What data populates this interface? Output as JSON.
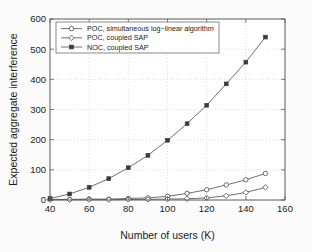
{
  "chart_data": {
    "type": "line",
    "title": "",
    "xlabel": "Number of users (K)",
    "ylabel": "Expected aggregate interference",
    "xlim": [
      40,
      160
    ],
    "ylim": [
      0,
      600
    ],
    "xticks": [
      40,
      60,
      80,
      100,
      120,
      140,
      160
    ],
    "yticks": [
      0,
      100,
      200,
      300,
      400,
      500,
      600
    ],
    "grid": true,
    "legend_position": "top-left",
    "x": [
      40,
      50,
      60,
      70,
      80,
      90,
      100,
      110,
      120,
      130,
      140,
      150
    ],
    "series": [
      {
        "name": "POC, simultaneous log−linear  algorithm",
        "marker": "circle-open",
        "values": [
          2,
          2,
          3,
          3,
          5,
          7,
          12,
          22,
          34,
          50,
          67,
          88
        ]
      },
      {
        "name": "POC, coupled SAP",
        "marker": "diamond-open",
        "values": [
          1,
          1,
          1,
          1,
          2,
          2,
          3,
          4,
          7,
          14,
          25,
          42
        ]
      },
      {
        "name": "NOC, coupled SAP",
        "marker": "square-filled",
        "values": [
          5,
          20,
          42,
          71,
          107,
          148,
          198,
          253,
          314,
          385,
          457,
          540
        ]
      }
    ]
  },
  "legend": {
    "entries": [
      {
        "label": "POC, simultaneous log−linear  algorithm"
      },
      {
        "label": "POC, coupled SAP"
      },
      {
        "label": "NOC, coupled SAP"
      }
    ]
  },
  "axes": {
    "x_title": "Number of users (K)",
    "y_title": "Expected aggregate interference",
    "x_tick_labels": [
      "40",
      "60",
      "80",
      "100",
      "120",
      "140",
      "160"
    ],
    "y_tick_labels": [
      "0",
      "100",
      "200",
      "300",
      "400",
      "500",
      "600"
    ]
  },
  "colors": {
    "line": "#4a4a4a",
    "filled_marker": "#3a3a3a",
    "grid": "#c9c9c9",
    "axis": "#5a5a5a",
    "text": "#1a1a1a",
    "background": "#ffffff"
  }
}
